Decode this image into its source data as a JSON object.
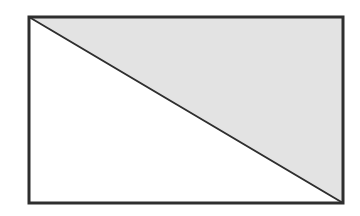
{
  "diagram": {
    "type": "rectangle-with-diagonal",
    "rectangle": {
      "x": 29,
      "y": 17,
      "width": 314,
      "height": 186,
      "stroke": "#2e2e2e",
      "stroke_width": 3
    },
    "diagonal": {
      "from": "top-left",
      "to": "bottom-right",
      "stroke": "#2e2e2e",
      "stroke_width": 2
    },
    "regions": [
      {
        "name": "upper-right-triangle",
        "fill": "#e3e3e3"
      },
      {
        "name": "lower-left-triangle",
        "fill": "#ffffff"
      }
    ]
  }
}
